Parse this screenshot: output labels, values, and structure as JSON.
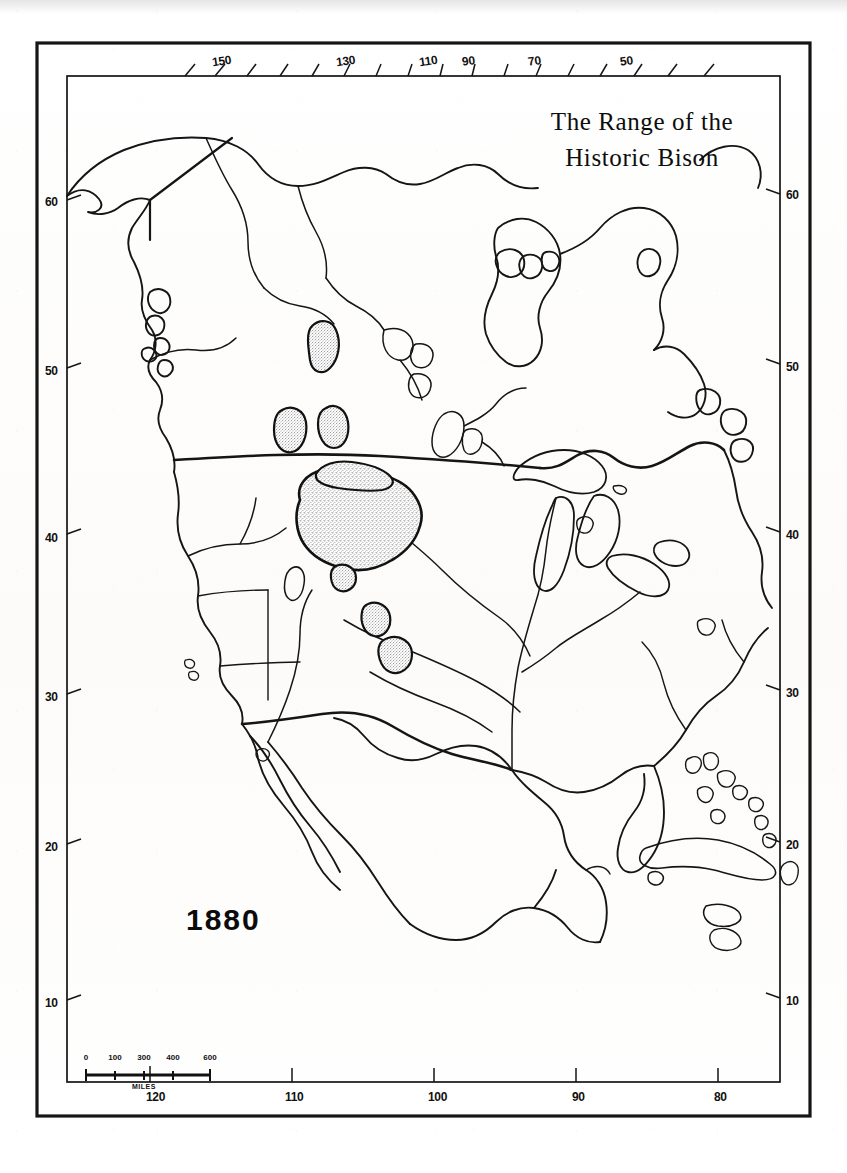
{
  "map": {
    "title_line_1": "The Range of the",
    "title_line_2": "Historic Bison",
    "date": "1880",
    "ink_color": "#111111",
    "paper_color": "#fdfdfc",
    "stipple_color": "#8f8f8f"
  },
  "axes": {
    "top": {
      "name": "longitude-top",
      "labels": [
        "150",
        "130",
        "110",
        "90",
        "70",
        "50"
      ],
      "positions": [
        212,
        336,
        419,
        462,
        528,
        620
      ]
    },
    "bottom": {
      "name": "longitude-bottom",
      "labels": [
        "120",
        "110",
        "100",
        "90",
        "80"
      ],
      "positions": [
        146,
        285,
        428,
        572,
        714
      ]
    },
    "left": {
      "name": "latitude-left",
      "labels": [
        "60",
        "50",
        "40",
        "30",
        "20",
        "10"
      ],
      "positions": [
        195,
        364,
        531,
        690,
        840,
        996
      ]
    },
    "right": {
      "name": "latitude-right",
      "labels": [
        "60",
        "50",
        "40",
        "30",
        "20",
        "10"
      ],
      "positions": [
        188,
        360,
        528,
        686,
        838,
        994
      ]
    }
  },
  "scalebar": {
    "ticks": [
      "0",
      "100",
      "300",
      "400",
      "600"
    ],
    "tick_positions": [
      0,
      29,
      58,
      87,
      124
    ],
    "units": "MILES"
  },
  "legend_regions": [
    {
      "name": "main-bison-range",
      "description": "Great Plains core range"
    },
    {
      "name": "northern-range-patch-1",
      "description": "Saskatchewan patch"
    },
    {
      "name": "northern-range-patch-2",
      "description": "Alberta patch"
    },
    {
      "name": "northern-range-patch-3",
      "description": "Manitoba patch"
    },
    {
      "name": "southern-range-patch-1",
      "description": "Colorado patch"
    },
    {
      "name": "southern-range-patch-2",
      "description": "Texas panhandle patch"
    }
  ]
}
